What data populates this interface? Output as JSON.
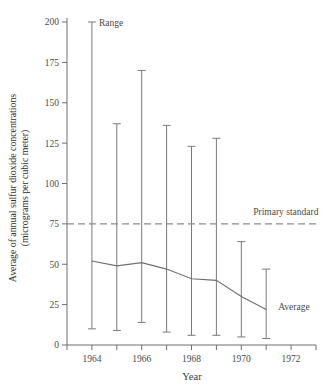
{
  "chart_data": {
    "type": "line",
    "title": "",
    "xlabel": "Year",
    "ylabel": "Average of annual sulfur dioxide concentrations (micrograms per cubic meter)",
    "ylabel_line1": "Average of annual sulfur dioxide concentrations",
    "ylabel_line2": "(micrograms per cubic meter)",
    "xlim": [
      1963,
      1973
    ],
    "ylim": [
      0,
      200
    ],
    "grid": false,
    "legend_position": "inline-annotations",
    "x": [
      1964,
      1965,
      1966,
      1967,
      1968,
      1969,
      1970,
      1971
    ],
    "xticks": [
      1963,
      1964,
      1965,
      1966,
      1967,
      1968,
      1969,
      1970,
      1971,
      1972,
      1973
    ],
    "xtick_labels": [
      "",
      "1964",
      "",
      "1966",
      "",
      "1968",
      "",
      "1970",
      "",
      "1972",
      ""
    ],
    "yticks": [
      0,
      25,
      50,
      75,
      100,
      125,
      150,
      175,
      200
    ],
    "ytick_labels": [
      "0",
      "25",
      "50",
      "75",
      "100",
      "125",
      "150",
      "175",
      "200"
    ],
    "series": [
      {
        "name": "Average",
        "type": "line",
        "values": [
          52,
          49,
          51,
          47,
          41,
          40,
          30,
          22
        ]
      },
      {
        "name": "Range",
        "type": "errorbar",
        "max_values": [
          200,
          137,
          170,
          136,
          123,
          128,
          64,
          47
        ],
        "min_values": [
          10,
          9,
          14,
          8,
          6,
          6,
          5,
          4
        ]
      }
    ],
    "reference_lines": [
      {
        "name": "Primary standard",
        "value": 75,
        "style": "dashed"
      }
    ],
    "annotations": [
      {
        "name": "Range",
        "text": "Range",
        "x": 1964,
        "y": 200
      },
      {
        "name": "Primary standard",
        "text": "Primary standard",
        "x": 1970.2,
        "y": 83
      },
      {
        "name": "Average",
        "text": "Average",
        "x": 1971.2,
        "y": 24
      }
    ]
  },
  "colors": {
    "axis": "#6f6f6f",
    "line": "#6f6f6f",
    "errorbar": "#7a7a7a",
    "reference": "#8a8a8a",
    "text": "#3a3a3a",
    "background": "#ffffff"
  }
}
